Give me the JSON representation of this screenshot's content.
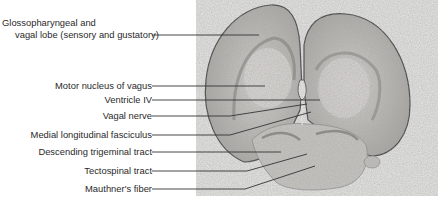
{
  "figure": {
    "type": "labeled histology micrograph",
    "labels": [
      {
        "id": "glossopharyngeal",
        "line1": "Glossopharyngeal and",
        "line2": "vagal lobe (sensory and gustatory)"
      },
      {
        "id": "motor-nucleus",
        "text": "Motor nucleus of vagus"
      },
      {
        "id": "ventricle",
        "text": "Ventricle IV"
      },
      {
        "id": "vagal-nerve",
        "text": "Vagal nerve"
      },
      {
        "id": "mlf",
        "text": "Medial longitudinal fasciculus"
      },
      {
        "id": "desc-trigeminal",
        "text": "Descending trigeminal tract"
      },
      {
        "id": "tectospinal",
        "text": "Tectospinal tract"
      },
      {
        "id": "mauthner",
        "text": "Mauthner's fiber"
      }
    ]
  }
}
